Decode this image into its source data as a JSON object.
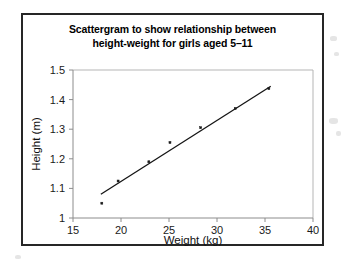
{
  "chart_data": {
    "type": "scatter",
    "title": "Scattergram to show relationship between height-weight for girls aged 5–11",
    "title_lines": [
      "Scattergram to show relationship between",
      "height-weight for girls aged 5–11"
    ],
    "xlabel": "Weight (kg)",
    "ylabel": "Height (m)",
    "xlim": [
      15,
      40
    ],
    "ylim": [
      1,
      1.5
    ],
    "xticks": [
      15,
      20,
      25,
      30,
      35,
      40
    ],
    "xtick_labels": [
      "15",
      "20",
      "25",
      "30",
      "35",
      "40"
    ],
    "yticks": [
      1,
      1.1,
      1.2,
      1.3,
      1.4,
      1.5
    ],
    "ytick_labels": [
      "1",
      "1.1",
      "1.2",
      "1.3",
      "1.4",
      "1.5"
    ],
    "grid": false,
    "legend": "none",
    "points": [
      {
        "x": 18.0,
        "y": 1.05
      },
      {
        "x": 19.7,
        "y": 1.125
      },
      {
        "x": 22.9,
        "y": 1.19
      },
      {
        "x": 25.1,
        "y": 1.255
      },
      {
        "x": 28.3,
        "y": 1.305
      },
      {
        "x": 31.9,
        "y": 1.37
      },
      {
        "x": 35.4,
        "y": 1.437
      }
    ],
    "series": [
      {
        "name": "height vs weight",
        "x": [
          18.0,
          19.7,
          22.9,
          25.1,
          28.3,
          31.9,
          35.4
        ],
        "values": [
          1.05,
          1.125,
          1.19,
          1.255,
          1.305,
          1.37,
          1.437
        ]
      }
    ],
    "trend_line": {
      "name": "line of best fit",
      "x_start": 17.9,
      "y_start": 1.08,
      "x_end": 35.6,
      "y_end": 1.445
    },
    "colors": {
      "frame": "#262626",
      "axis": "#8c8c8c",
      "plot_border": "#b5b5b5",
      "marker": "#1a1a1a",
      "trend_line": "#141414",
      "background": "#ffffff",
      "text": "#000000"
    }
  }
}
